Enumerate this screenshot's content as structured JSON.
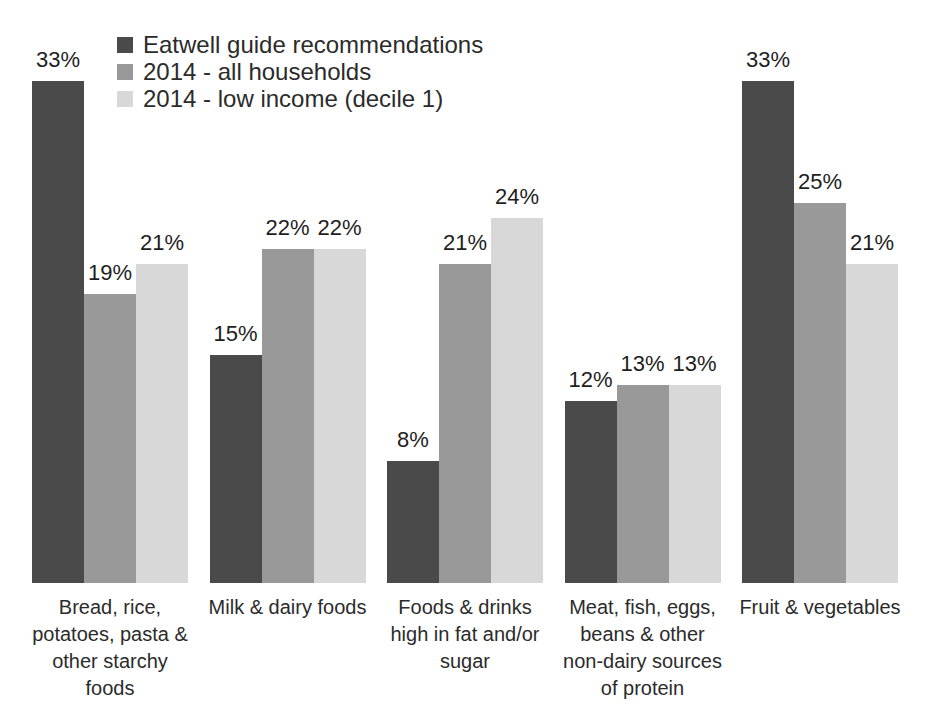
{
  "chart_data": {
    "type": "bar",
    "title": "",
    "unit": "%",
    "categories": [
      "Bread, rice,\npotatoes, pasta &\nother starchy\nfoods",
      "Milk & dairy foods",
      "Foods & drinks\nhigh in fat and/or\nsugar",
      "Meat, fish, eggs,\nbeans & other\nnon-dairy sources\nof protein",
      "Fruit & vegetables"
    ],
    "series": [
      {
        "name": "Eatwell guide recommendations",
        "color": "#4a4a4a",
        "values": [
          33,
          15,
          8,
          12,
          33
        ]
      },
      {
        "name": "2014 - all households",
        "color": "#999999",
        "values": [
          19,
          22,
          21,
          13,
          25
        ]
      },
      {
        "name": "2014 - low income (decile 1)",
        "color": "#d8d8d8",
        "values": [
          21,
          22,
          24,
          13,
          21
        ]
      }
    ],
    "data_labels_visible": true,
    "ylim": [
      0,
      34
    ],
    "grid": false,
    "axes_visible": false,
    "legend_position": "top-left",
    "background_color": "#ffffff"
  }
}
